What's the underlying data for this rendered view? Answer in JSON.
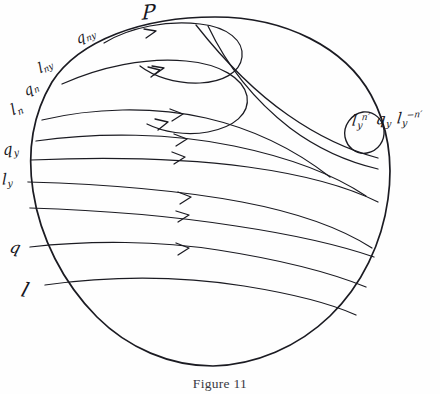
{
  "figure": {
    "caption": "Figure 11",
    "apex_label": "P",
    "ink_color": "#1b1b22",
    "background_color": "#fefefe"
  },
  "boundary_labels": [
    {
      "name": "q-ny",
      "base": "q",
      "sub": "ny",
      "sup": ""
    },
    {
      "name": "l-ny",
      "base": "l",
      "sub": "ny",
      "sup": ""
    },
    {
      "name": "q-n",
      "base": "q",
      "sub": "n",
      "sup": ""
    },
    {
      "name": "l-n",
      "base": "l",
      "sub": "n",
      "sup": ""
    },
    {
      "name": "q-y",
      "base": "q",
      "sub": "y",
      "sup": ""
    },
    {
      "name": "l-y",
      "base": "l",
      "sub": "y",
      "sup": ""
    },
    {
      "name": "q",
      "base": "q",
      "sub": "",
      "sup": ""
    },
    {
      "name": "l",
      "base": "l",
      "sub": "",
      "sup": ""
    }
  ],
  "conjugate_label": {
    "term1_base": "l",
    "term1_sub": "y",
    "term1_sup": "n′",
    "term2_base": "q",
    "term2_sub": "y",
    "term3_base": "l",
    "term3_sub": "y",
    "term3_sup": "−n′"
  }
}
